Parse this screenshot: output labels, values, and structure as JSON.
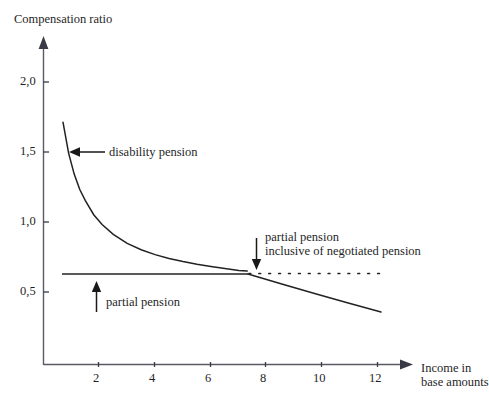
{
  "chart_data": {
    "type": "line",
    "title": "Compensation ratio",
    "xlabel": "Income in base amounts",
    "ylabel": "Compensation ratio",
    "xlim": [
      0,
      13.2
    ],
    "ylim": [
      0,
      2.25
    ],
    "grid": false,
    "legend_position": "none",
    "xticks": [
      2,
      4,
      6,
      8,
      10,
      12
    ],
    "xtick_labels": [
      "2",
      "4",
      "6",
      "8",
      "10",
      "12"
    ],
    "yticks": [
      0.5,
      1.0,
      1.5,
      2.0
    ],
    "ytick_labels": [
      "0,5",
      "1,0",
      "1,5",
      "2,0"
    ],
    "series": [
      {
        "name": "disability pension",
        "style": "solid",
        "x": [
          0.7,
          0.9,
          1.1,
          1.3,
          1.5,
          1.8,
          2.1,
          2.5,
          3.0,
          3.5,
          4.0,
          4.5,
          5.0,
          5.5,
          6.0,
          6.5,
          7.0,
          7.3
        ],
        "values": [
          1.73,
          1.51,
          1.36,
          1.25,
          1.17,
          1.07,
          1.0,
          0.93,
          0.865,
          0.82,
          0.785,
          0.757,
          0.735,
          0.716,
          0.7,
          0.686,
          0.672,
          0.667
        ]
      },
      {
        "name": "partial pension",
        "style": "solid",
        "x": [
          0.68,
          7.3
        ],
        "values": [
          0.665,
          0.665
        ]
      },
      {
        "name": "partial pension inclusive of negotiated pension",
        "style": "dotted",
        "x": [
          7.3,
          12.3
        ],
        "values": [
          0.665,
          0.665
        ]
      },
      {
        "name": "partial pension declining",
        "style": "solid",
        "x": [
          7.3,
          8.5,
          10.0,
          11.5,
          12.1
        ],
        "values": [
          0.665,
          0.6,
          0.53,
          0.465,
          0.44
        ]
      }
    ],
    "annotations": [
      {
        "name": "disability-pension",
        "text": "disability pension",
        "arrow": "left",
        "target_x": 1.05,
        "target_y": 1.45
      },
      {
        "name": "partial-pension",
        "text": "partial pension",
        "arrow": "up",
        "target_x": 1.9,
        "target_y": 0.665
      },
      {
        "name": "partial-pension-inclusive",
        "text": "partial pension\ninclusive of negotiated pension",
        "line1": "partial pension",
        "line2": "inclusive of negotiated pension",
        "arrow": "down",
        "target_x": 7.5,
        "target_y": 0.665
      }
    ],
    "colors": {
      "line": "#1f1f1f",
      "axis": "#4a4a56",
      "background": "#ffffff",
      "text": "#1f1f1f"
    }
  },
  "axes": {
    "y_title": "Compensation ratio",
    "x_title_line1": "Income in",
    "x_title_line2": "base amounts",
    "ytick_labels": {
      "t20": "2,0",
      "t15": "1,5",
      "t10": "1,0",
      "t05": "0,5"
    },
    "xtick_labels": {
      "t2": "2",
      "t4": "4",
      "t6": "6",
      "t8": "8",
      "t10": "10",
      "t12": "12"
    }
  },
  "labels": {
    "disability_pension": "disability pension",
    "partial_pension": "partial pension",
    "partial_pension_incl_line1": "partial pension",
    "partial_pension_incl_line2": "inclusive of negotiated pension"
  }
}
